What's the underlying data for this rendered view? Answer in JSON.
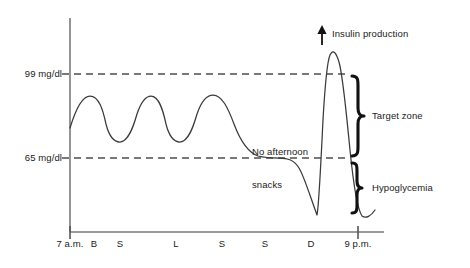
{
  "chart_data": {
    "type": "line",
    "title": "",
    "xlabel": "",
    "ylabel": "",
    "subtitle": "",
    "grid": false,
    "legend_position": "none",
    "style": {
      "curve_color": "#3a3a3a",
      "axis_color": "#7a7a7a",
      "dash_color": "#4d4d4d",
      "brace_color": "#111111",
      "text_color": "#1a1a1a",
      "background": "#ffffff"
    },
    "x_axis": {
      "range_label_start": "7 a.m.",
      "range_label_end": "9 p.m.",
      "tick_labels": [
        "7 a.m.",
        "B",
        "S",
        "L",
        "S",
        "S",
        "D",
        "9 p.m."
      ],
      "tick_meanings": [
        "7 a.m.",
        "Breakfast",
        "Snack",
        "Lunch",
        "Snack",
        "Snack",
        "Dinner",
        "9 p.m."
      ],
      "tick_x": [
        70,
        94,
        120,
        176,
        222,
        265,
        311,
        358
      ]
    },
    "y_axis": {
      "reference_lines": [
        {
          "label": "99 mg/dl",
          "value": 99,
          "y": 74
        },
        {
          "label": "65 mg/dl",
          "value": 65,
          "y": 158
        }
      ]
    },
    "annotations": [
      {
        "name": "insulin-production",
        "text": "Insulin production",
        "icon": "up-arrow-icon",
        "x": 332,
        "y": 28
      },
      {
        "name": "no-afternoon-snacks",
        "line1": "No afternoon",
        "line2": "snacks",
        "x": 252,
        "y": 124
      }
    ],
    "zones": [
      {
        "name": "target-zone",
        "label": "Target zone",
        "brace": "curly-brace-icon",
        "from_value": 65,
        "to_value": 99
      },
      {
        "name": "hypoglycemia-zone",
        "label": "Hypoglycemia",
        "brace": "curly-brace-icon",
        "below_value": 65
      }
    ],
    "series": [
      {
        "name": "blood-glucose",
        "description": "Blood glucose level through the day with three post-meal oscillations within target zone, a decline to the 65 mg/dl floor in the afternoon with no snacks, a dip into hypoglycemia, a sharp dinner spike above 99 mg/dl driven by insulin production, and a steep fall into hypoglycemia by 9 p.m.",
        "path": "M 70,128 C 76,108 82,96 90,96 C 99,96 103,110 106,124 C 109,136 113,142 120,142 C 128,142 133,128 137,114 C 141,102 145,96 151,96 C 159,96 163,110 166,124 C 169,136 173,142 180,142 C 188,142 193,128 197,114 C 201,102 206,95 213,95 C 222,95 228,108 234,124 C 240,140 247,152 258,156 C 266,158 272,158 279,158 C 288,158 294,160 299,168 C 304,176 310,196 317,215 C 319,205 321,160 323,120 C 325,85 327,62 330,55 C 333,49 336,52 339,62 C 343,76 346,110 350,150 C 354,190 358,210 362,216 C 366,219 371,216 375,210"
      }
    ]
  }
}
